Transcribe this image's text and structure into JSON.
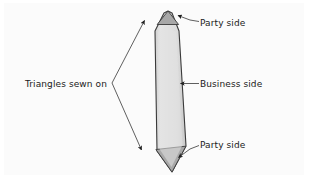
{
  "figure": {
    "kind": "necktie-sewing-diagram",
    "background_color": "#fbfbfb",
    "page_color": "#ffffff",
    "labels": {
      "party_side_top": "Party side",
      "business_side": "Business side",
      "party_side_bottom": "Party side",
      "triangles_sewn_on": "Triangles sewn on"
    },
    "colors": {
      "tie_body_fill": "#d9d9d9",
      "tie_body_highlight": "#e4e4e4",
      "tie_tip_fill": "#a8a8a8",
      "outline": "#3a3a3a",
      "leader_line": "#555555",
      "text": "#1a1a1a"
    },
    "shapes": {
      "tie_outline_points": "168,11 179,30 186,145 172,172 157,152 155,30",
      "top_triangle_points": "168,11 178,24 158,24",
      "bottom_triangle_points": "156,150 186,147 172,172",
      "tie_tip_top": {
        "x": 168,
        "y": 11
      },
      "tie_tip_bottom": {
        "x": 172,
        "y": 172
      }
    },
    "annotations": [
      {
        "name": "party-side-top",
        "target": {
          "x": 174,
          "y": 19
        },
        "anchor": {
          "x": 198,
          "y": 22
        },
        "arrow": "points-up-left"
      },
      {
        "name": "business-side",
        "target": {
          "x": 180,
          "y": 84
        },
        "anchor": {
          "x": 198,
          "y": 84
        },
        "arrow": "points-left"
      },
      {
        "name": "party-side-bottom",
        "target": {
          "x": 174,
          "y": 159
        },
        "anchor": {
          "x": 198,
          "y": 146
        },
        "arrow": "points-down-left"
      },
      {
        "name": "triangles-sewn-on-bracket",
        "vertex": {
          "x": 112,
          "y": 83
        },
        "arrow_top": {
          "x": 146,
          "y": 20
        },
        "arrow_bottom": {
          "x": 143,
          "y": 150
        }
      }
    ]
  }
}
